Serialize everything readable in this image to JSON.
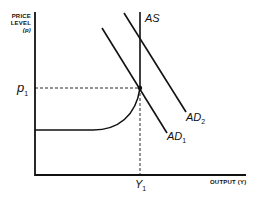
{
  "diagram": {
    "y_axis": {
      "label_line1": "PRICE",
      "label_line2": "LEVEL",
      "label_line3": "(p)"
    },
    "x_axis": {
      "label": "OUTPUT (Y)"
    },
    "curves": {
      "as": {
        "label": "AS"
      },
      "ad1": {
        "label": "AD",
        "sub": "1"
      },
      "ad2": {
        "label": "AD",
        "sub": "2"
      }
    },
    "markers": {
      "p1": {
        "label": "p",
        "sub": "1"
      },
      "y1": {
        "label": "Y",
        "sub": "1"
      }
    },
    "colors": {
      "line": "#111111",
      "background": "#ffffff"
    }
  }
}
